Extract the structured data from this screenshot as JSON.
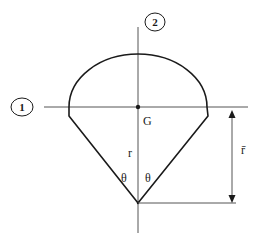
{
  "diagram": {
    "type": "cross-section",
    "axes": [
      {
        "id": "axis-1",
        "label": "1",
        "orientation": "horizontal"
      },
      {
        "id": "axis-2",
        "label": "2",
        "orientation": "vertical"
      }
    ],
    "labels": {
      "centroid": "G",
      "radius": "r",
      "angle_left": "θ",
      "angle_right": "θ",
      "centroid_distance": "r̄"
    },
    "colors": {
      "stroke": "#1a1a1a",
      "axis": "#555555",
      "background": "#ffffff"
    }
  }
}
